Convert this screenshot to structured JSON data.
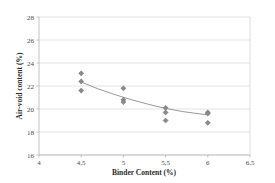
{
  "chart_data": {
    "type": "scatter",
    "title": "",
    "xlabel": "Binder Content (%)",
    "ylabel": "Air-void content (%)",
    "xlim": [
      4,
      6.5
    ],
    "ylim": [
      16,
      28
    ],
    "xticks": [
      "4",
      "4,5",
      "5",
      "5,5",
      "6",
      "6,5"
    ],
    "xtick_values": [
      4,
      4.5,
      5,
      5.5,
      6,
      6.5
    ],
    "yticks": [
      "16",
      "18",
      "20",
      "22",
      "24",
      "26",
      "28"
    ],
    "ytick_values": [
      16,
      18,
      20,
      22,
      24,
      26,
      28
    ],
    "grid": "horizontal",
    "legend": "none",
    "marker_style": "diamond",
    "marker_color": "#8a8a8a",
    "trendline_color": "#8c8c8c",
    "series": [
      {
        "name": "Air-void content measurements",
        "points": [
          {
            "x": 4.5,
            "y": 23.1
          },
          {
            "x": 4.5,
            "y": 22.4
          },
          {
            "x": 4.5,
            "y": 21.6
          },
          {
            "x": 5.0,
            "y": 21.8
          },
          {
            "x": 5.0,
            "y": 20.8
          },
          {
            "x": 5.0,
            "y": 20.6
          },
          {
            "x": 5.5,
            "y": 20.1
          },
          {
            "x": 5.5,
            "y": 19.7
          },
          {
            "x": 5.5,
            "y": 19.0
          },
          {
            "x": 6.0,
            "y": 19.7
          },
          {
            "x": 6.0,
            "y": 19.6
          },
          {
            "x": 6.0,
            "y": 18.8
          }
        ]
      }
    ],
    "trendline": {
      "name": "fitted trend",
      "points": [
        {
          "x": 4.5,
          "y": 22.35
        },
        {
          "x": 4.7,
          "y": 21.75
        },
        {
          "x": 4.9,
          "y": 21.25
        },
        {
          "x": 5.1,
          "y": 20.8
        },
        {
          "x": 5.3,
          "y": 20.4
        },
        {
          "x": 5.5,
          "y": 20.05
        },
        {
          "x": 5.7,
          "y": 19.78
        },
        {
          "x": 5.9,
          "y": 19.58
        },
        {
          "x": 6.0,
          "y": 19.5
        }
      ]
    }
  }
}
